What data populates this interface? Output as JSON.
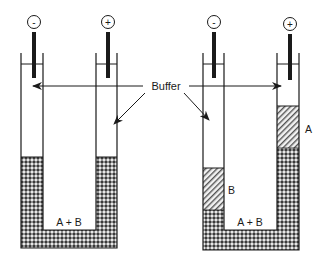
{
  "diagram": {
    "labels": {
      "buffer": "Buffer",
      "mixture_left": "A + B",
      "mixture_right": "A + B",
      "band_a": "A",
      "band_b": "B"
    },
    "electrodes": {
      "left_tube_left": "-",
      "left_tube_right": "+",
      "right_tube_left": "-",
      "right_tube_right": "+"
    },
    "colors": {
      "line": "#1a1a1a",
      "mixture_fill": "#6b6b6b",
      "band_fill": "#9a9a9a",
      "background": "#ffffff"
    }
  }
}
